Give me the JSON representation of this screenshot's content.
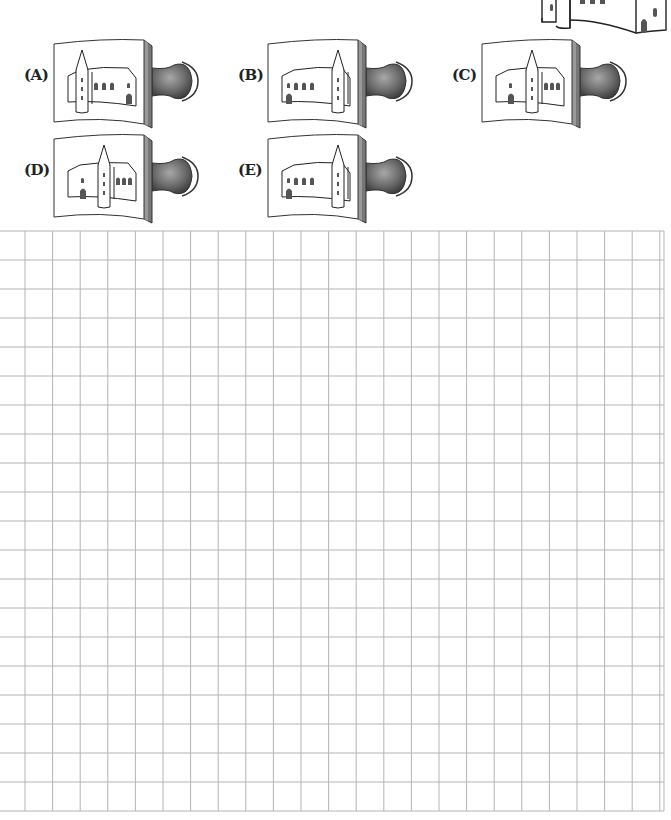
{
  "puzzle": {
    "reference_image": {
      "icon": "castle-reference-icon"
    },
    "options": [
      {
        "label": "(A)",
        "id": "A",
        "x": 24,
        "y": 103,
        "stamp_x": 52,
        "stamp_y": 38,
        "tower": "left",
        "mirror": false,
        "variant": 1
      },
      {
        "label": "(B)",
        "id": "B",
        "x": 238,
        "y": 80,
        "stamp_x": 266,
        "stamp_y": 38,
        "tower": "right",
        "mirror": true,
        "variant": 2
      },
      {
        "label": "(C)",
        "id": "C",
        "x": 452,
        "y": 80,
        "stamp_x": 480,
        "stamp_y": 38,
        "tower": "center",
        "mirror": false,
        "variant": 3
      },
      {
        "label": "(D)",
        "id": "D",
        "x": 24,
        "y": 174,
        "stamp_x": 52,
        "stamp_y": 133,
        "tower": "center",
        "mirror": true,
        "variant": 4
      },
      {
        "label": "(E)",
        "id": "E",
        "x": 238,
        "y": 174,
        "stamp_x": 266,
        "stamp_y": 133,
        "tower": "right",
        "mirror": true,
        "variant": 5
      }
    ]
  },
  "grid": {
    "left": 0,
    "top": 231,
    "right": 664,
    "bottom": 811,
    "col_start": 25,
    "col_step": 27.6,
    "row_step": 29,
    "line_color": "#b4b4b4"
  },
  "colors": {
    "ink": "#222222",
    "handle": "#6b6b6b",
    "window": "#555555"
  }
}
